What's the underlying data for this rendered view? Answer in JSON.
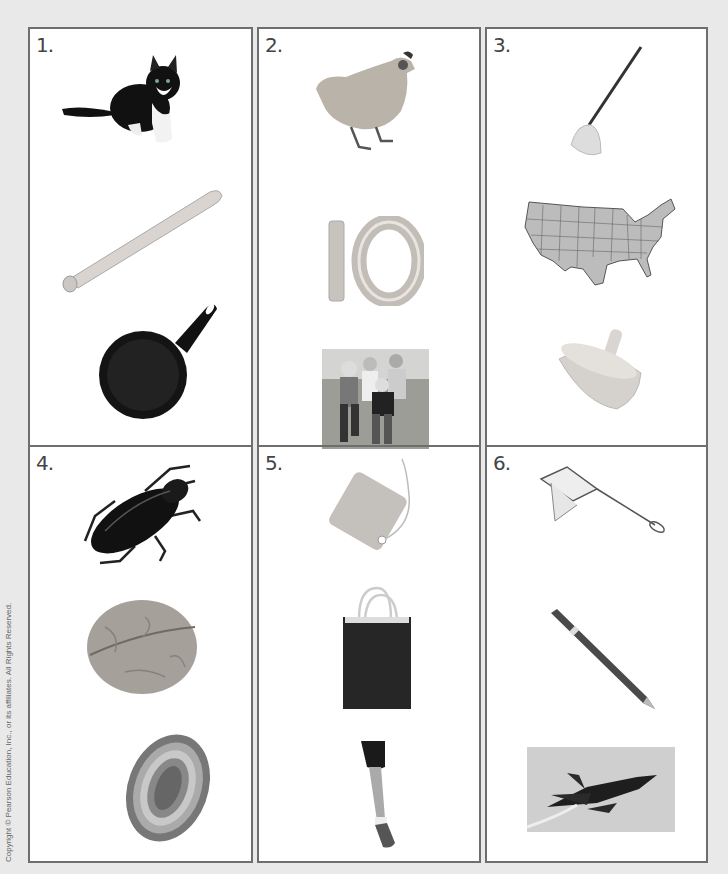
{
  "page": {
    "background": "#e9e9e9",
    "border_color": "#6e6e6e",
    "copyright": "Copyright © Pearson Education, Inc., or its affiliates. All Rights Reserved."
  },
  "boxes": [
    {
      "number": "1.",
      "pictures": [
        "cat",
        "baseball bat",
        "frying pan"
      ]
    },
    {
      "number": "2.",
      "pictures": [
        "hen",
        "ten (10)",
        "family"
      ]
    },
    {
      "number": "3.",
      "pictures": [
        "mop",
        "map",
        "top"
      ]
    },
    {
      "number": "4.",
      "pictures": [
        "bug",
        "nut",
        "rug"
      ]
    },
    {
      "number": "5.",
      "pictures": [
        "tag",
        "bag",
        "leg"
      ]
    },
    {
      "number": "6.",
      "pictures": [
        "net",
        "pen",
        "jet"
      ]
    }
  ]
}
